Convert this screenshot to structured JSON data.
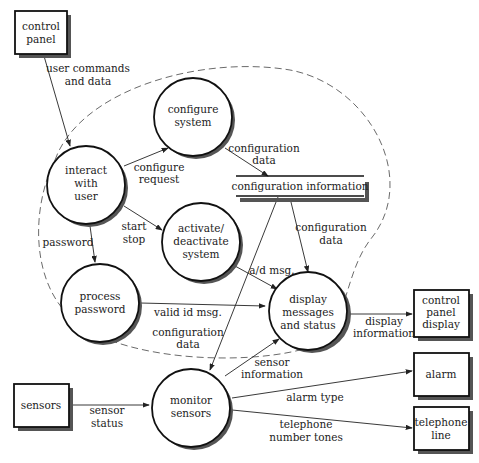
{
  "diagram": {
    "type": "data-flow-diagram",
    "externals": [
      {
        "id": "control_panel",
        "label": [
          "control",
          "panel"
        ]
      },
      {
        "id": "control_panel_display",
        "label": [
          "control",
          "panel",
          "display"
        ]
      },
      {
        "id": "alarm",
        "label": [
          "alarm"
        ]
      },
      {
        "id": "telephone_line",
        "label": [
          "telephone",
          "line"
        ]
      },
      {
        "id": "sensors",
        "label": [
          "sensors"
        ]
      }
    ],
    "processes": [
      {
        "id": "interact_with_user",
        "label": [
          "interact",
          "with",
          "user"
        ]
      },
      {
        "id": "configure_system",
        "label": [
          "configure",
          "system"
        ]
      },
      {
        "id": "activate_deactivate_system",
        "label": [
          "activate/",
          "deactivate",
          "system"
        ]
      },
      {
        "id": "process_password",
        "label": [
          "process",
          "password"
        ]
      },
      {
        "id": "display_messages_and_status",
        "label": [
          "display",
          "messages",
          "and status"
        ]
      },
      {
        "id": "monitor_sensors",
        "label": [
          "monitor",
          "sensors"
        ]
      }
    ],
    "data_store": {
      "id": "configuration_information",
      "label": "configuration information"
    },
    "flows": [
      {
        "from": "control_panel",
        "to": "interact_with_user",
        "label": [
          "user commands",
          "and data"
        ]
      },
      {
        "from": "interact_with_user",
        "to": "configure_system",
        "label": [
          "configure",
          "request"
        ]
      },
      {
        "from": "configure_system",
        "to": "configuration_information",
        "label": [
          "configuration",
          "data"
        ]
      },
      {
        "from": "interact_with_user",
        "to": "activate_deactivate_system",
        "label": [
          "start",
          "stop"
        ]
      },
      {
        "from": "interact_with_user",
        "to": "process_password",
        "label": [
          "password"
        ]
      },
      {
        "from": "configuration_information",
        "to": "display_messages_and_status",
        "label": [
          "configuration",
          "data"
        ]
      },
      {
        "from": "activate_deactivate_system",
        "to": "display_messages_and_status",
        "label": [
          "a/d msg."
        ]
      },
      {
        "from": "process_password",
        "to": "display_messages_and_status",
        "label": [
          "valid id msg."
        ]
      },
      {
        "from": "configuration_information",
        "to": "monitor_sensors",
        "label": [
          "configuration",
          "data"
        ]
      },
      {
        "from": "display_messages_and_status",
        "to": "control_panel_display",
        "label": [
          "display",
          "information"
        ]
      },
      {
        "from": "monitor_sensors",
        "to": "display_messages_and_status",
        "label": [
          "sensor",
          "information"
        ]
      },
      {
        "from": "sensors",
        "to": "monitor_sensors",
        "label": [
          "sensor",
          "status"
        ]
      },
      {
        "from": "monitor_sensors",
        "to": "alarm",
        "label": [
          "alarm type"
        ]
      },
      {
        "from": "monitor_sensors",
        "to": "telephone_line",
        "label": [
          "telephone",
          "number tones"
        ]
      }
    ]
  }
}
